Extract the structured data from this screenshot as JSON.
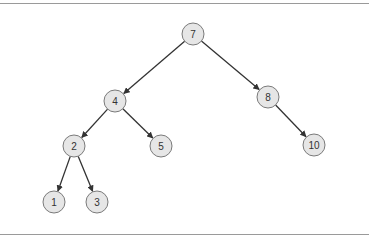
{
  "diagram": {
    "type": "binary-search-tree",
    "nodes": [
      {
        "id": "n7",
        "label": "7",
        "x": 193,
        "y": 34
      },
      {
        "id": "n4",
        "label": "4",
        "x": 115,
        "y": 101
      },
      {
        "id": "n8",
        "label": "8",
        "x": 268,
        "y": 97
      },
      {
        "id": "n2",
        "label": "2",
        "x": 74,
        "y": 146
      },
      {
        "id": "n5",
        "label": "5",
        "x": 161,
        "y": 146
      },
      {
        "id": "n10",
        "label": "10",
        "x": 314,
        "y": 145
      },
      {
        "id": "n1",
        "label": "1",
        "x": 54,
        "y": 202
      },
      {
        "id": "n3",
        "label": "3",
        "x": 97,
        "y": 202
      }
    ],
    "edges": [
      {
        "from": "7",
        "to": "4"
      },
      {
        "from": "7",
        "to": "8"
      },
      {
        "from": "4",
        "to": "2"
      },
      {
        "from": "4",
        "to": "5"
      },
      {
        "from": "8",
        "to": "10"
      },
      {
        "from": "2",
        "to": "1"
      },
      {
        "from": "2",
        "to": "3"
      }
    ],
    "colors": {
      "node_fill": "#e6e6e6",
      "node_stroke": "#7a7a7a",
      "edge": "#333333",
      "border": "#9a9a9a"
    }
  }
}
